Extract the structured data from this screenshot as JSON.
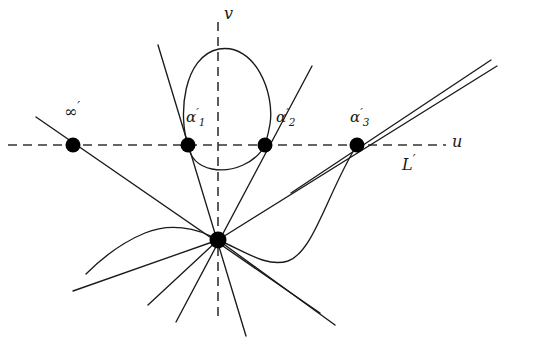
{
  "figure": {
    "background_color": "#ffffff",
    "stroke_color": "#1a1a1a",
    "dash_color": "#333333",
    "node_color": "#000000"
  },
  "axes": {
    "u_axis": {
      "label": "u",
      "style": "dashed",
      "y": 145,
      "x_start": 8,
      "x_end": 446
    },
    "v_axis": {
      "label": "v",
      "style": "dashed",
      "x": 218,
      "y_start": 22,
      "y_end": 318
    },
    "line_label": "L",
    "line_label_prime": "′"
  },
  "points": [
    {
      "name": "point-infinity",
      "label_base": "∞",
      "label_prime": "′",
      "label_sub": "",
      "x": 73,
      "y": 145,
      "radius": 7.5
    },
    {
      "name": "point-alpha-1",
      "label_base": "α",
      "label_prime": "′",
      "label_sub": "1",
      "x": 188,
      "y": 145,
      "radius": 7.5
    },
    {
      "name": "point-alpha-2",
      "label_base": "α",
      "label_prime": "′",
      "label_sub": "2",
      "x": 265,
      "y": 145,
      "radius": 7.5
    },
    {
      "name": "point-alpha-3",
      "label_base": "α",
      "label_prime": "′",
      "label_sub": "3",
      "x": 357,
      "y": 145,
      "radius": 7.5
    },
    {
      "name": "point-node",
      "label_base": "",
      "label_prime": "",
      "label_sub": "",
      "x": 218,
      "y": 240,
      "radius": 8.5
    }
  ],
  "curves": {
    "oval_loop": "M 188 145 C 176 112 182 54 219 48 C 256 43 274 92 270 122 C 267 143 266 145 265 145 C 253 164 229 172 211 168 C 196 165 190 157 188 145 Z",
    "s_branch": "M 218 240 C 240 248 262 266 285 262 C 312 257 327 192 357 145",
    "left_whisker": "M 218 240 C 196 228 170 224 146 234 C 124 243 104 258 86 274"
  },
  "straight_lines": [
    {
      "name": "line-infinity-to-node",
      "x1": 36,
      "y1": 117,
      "x2": 320,
      "y2": 313
    },
    {
      "name": "line-alpha1-steep",
      "x1": 158,
      "y1": 45,
      "x2": 246,
      "y2": 336
    },
    {
      "name": "line-alpha2-rising",
      "x1": 312,
      "y1": 66,
      "x2": 176,
      "y2": 322
    },
    {
      "name": "line-node-to-alpha3-upper",
      "x1": 218,
      "y1": 240,
      "x2": 497,
      "y2": 66
    },
    {
      "name": "line-alpha3-through-upper",
      "x1": 296,
      "y1": 189,
      "x2": 491,
      "y2": 60
    },
    {
      "name": "line-node-down-left-shallow",
      "x1": 218,
      "y1": 240,
      "x2": 73,
      "y2": 291
    },
    {
      "name": "line-node-down-left-mid",
      "x1": 218,
      "y1": 240,
      "x2": 148,
      "y2": 305
    },
    {
      "name": "line-node-down-right",
      "x1": 218,
      "y1": 240,
      "x2": 335,
      "y2": 325
    }
  ]
}
